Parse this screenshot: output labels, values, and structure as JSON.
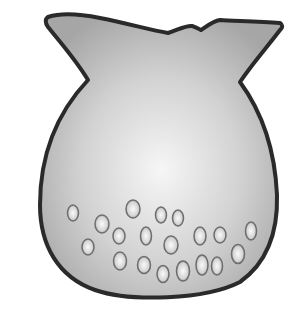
{
  "figure": {
    "colors": {
      "background": "#ffffff",
      "outline": "#2a2a2a",
      "fill_light": "#f4f4f4",
      "fill_mid": "#cfcfcf",
      "fill_dark": "#a8a8a8",
      "bubble_rim": "#6e6e6e"
    },
    "bubbles": [
      {
        "cx": 73,
        "cy": 213,
        "rx": 5.5,
        "ry": 8
      },
      {
        "cx": 102,
        "cy": 224,
        "rx": 7,
        "ry": 9
      },
      {
        "cx": 133,
        "cy": 209,
        "rx": 7,
        "ry": 9
      },
      {
        "cx": 161,
        "cy": 215,
        "rx": 5.5,
        "ry": 8
      },
      {
        "cx": 178,
        "cy": 218,
        "rx": 5.5,
        "ry": 8
      },
      {
        "cx": 119,
        "cy": 236,
        "rx": 6,
        "ry": 8
      },
      {
        "cx": 146,
        "cy": 236,
        "rx": 5.5,
        "ry": 9
      },
      {
        "cx": 171,
        "cy": 245,
        "rx": 7,
        "ry": 9
      },
      {
        "cx": 200,
        "cy": 236,
        "rx": 6,
        "ry": 9
      },
      {
        "cx": 220,
        "cy": 235,
        "rx": 6,
        "ry": 8
      },
      {
        "cx": 251,
        "cy": 231,
        "rx": 5.5,
        "ry": 9
      },
      {
        "cx": 88,
        "cy": 247,
        "rx": 6,
        "ry": 8
      },
      {
        "cx": 120,
        "cy": 261,
        "rx": 6.5,
        "ry": 9
      },
      {
        "cx": 144,
        "cy": 265,
        "rx": 6.5,
        "ry": 8.5
      },
      {
        "cx": 163,
        "cy": 274,
        "rx": 6,
        "ry": 8.5
      },
      {
        "cx": 183,
        "cy": 271,
        "rx": 6.5,
        "ry": 10
      },
      {
        "cx": 202,
        "cy": 265,
        "rx": 6,
        "ry": 10
      },
      {
        "cx": 217,
        "cy": 266,
        "rx": 5.5,
        "ry": 9
      },
      {
        "cx": 238,
        "cy": 254,
        "rx": 6.5,
        "ry": 9.5
      }
    ]
  }
}
